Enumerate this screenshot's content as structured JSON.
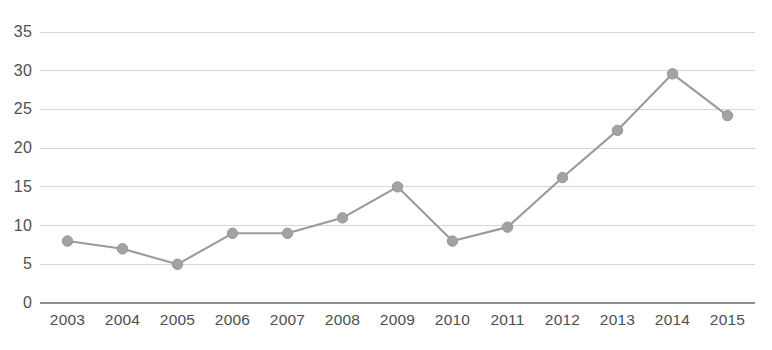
{
  "chart_data": {
    "type": "line",
    "title": "",
    "subtitle": "",
    "xlabel": "",
    "ylabel": "",
    "categories": [
      "2003",
      "2004",
      "2005",
      "2006",
      "2007",
      "2008",
      "2009",
      "2010",
      "2011",
      "2012",
      "2013",
      "2014",
      "2015"
    ],
    "values": [
      8,
      7,
      5,
      9,
      9,
      11,
      15,
      8,
      9.8,
      16.2,
      22.3,
      29.6,
      24.2
    ],
    "series": [
      {
        "name": "",
        "values": [
          8,
          7,
          5,
          9,
          9,
          11,
          15,
          8,
          9.8,
          16.2,
          22.3,
          29.6,
          24.2
        ]
      }
    ],
    "ylim": [
      0,
      35
    ],
    "yticks": [
      0,
      5,
      10,
      15,
      20,
      25,
      30,
      35
    ],
    "ytick_labels": [
      "0",
      "5",
      "10",
      "15",
      "20",
      "25",
      "30",
      "35"
    ],
    "grid": true,
    "grid_axis": "y",
    "legend": false,
    "legend_position": "none",
    "markers": true,
    "colors": {
      "line": "#9a9a9a",
      "marker": "#a2a2a2",
      "gridline": "#d6d6d6",
      "axis": "#8f8f8f",
      "text": "#4f4f4f",
      "background": "#ffffff"
    }
  },
  "layout": {
    "plot_left": 40,
    "plot_right": 755,
    "plot_top": 32,
    "plot_bottom": 303,
    "y_label_right_edge": 32,
    "x_label_top": 312
  }
}
